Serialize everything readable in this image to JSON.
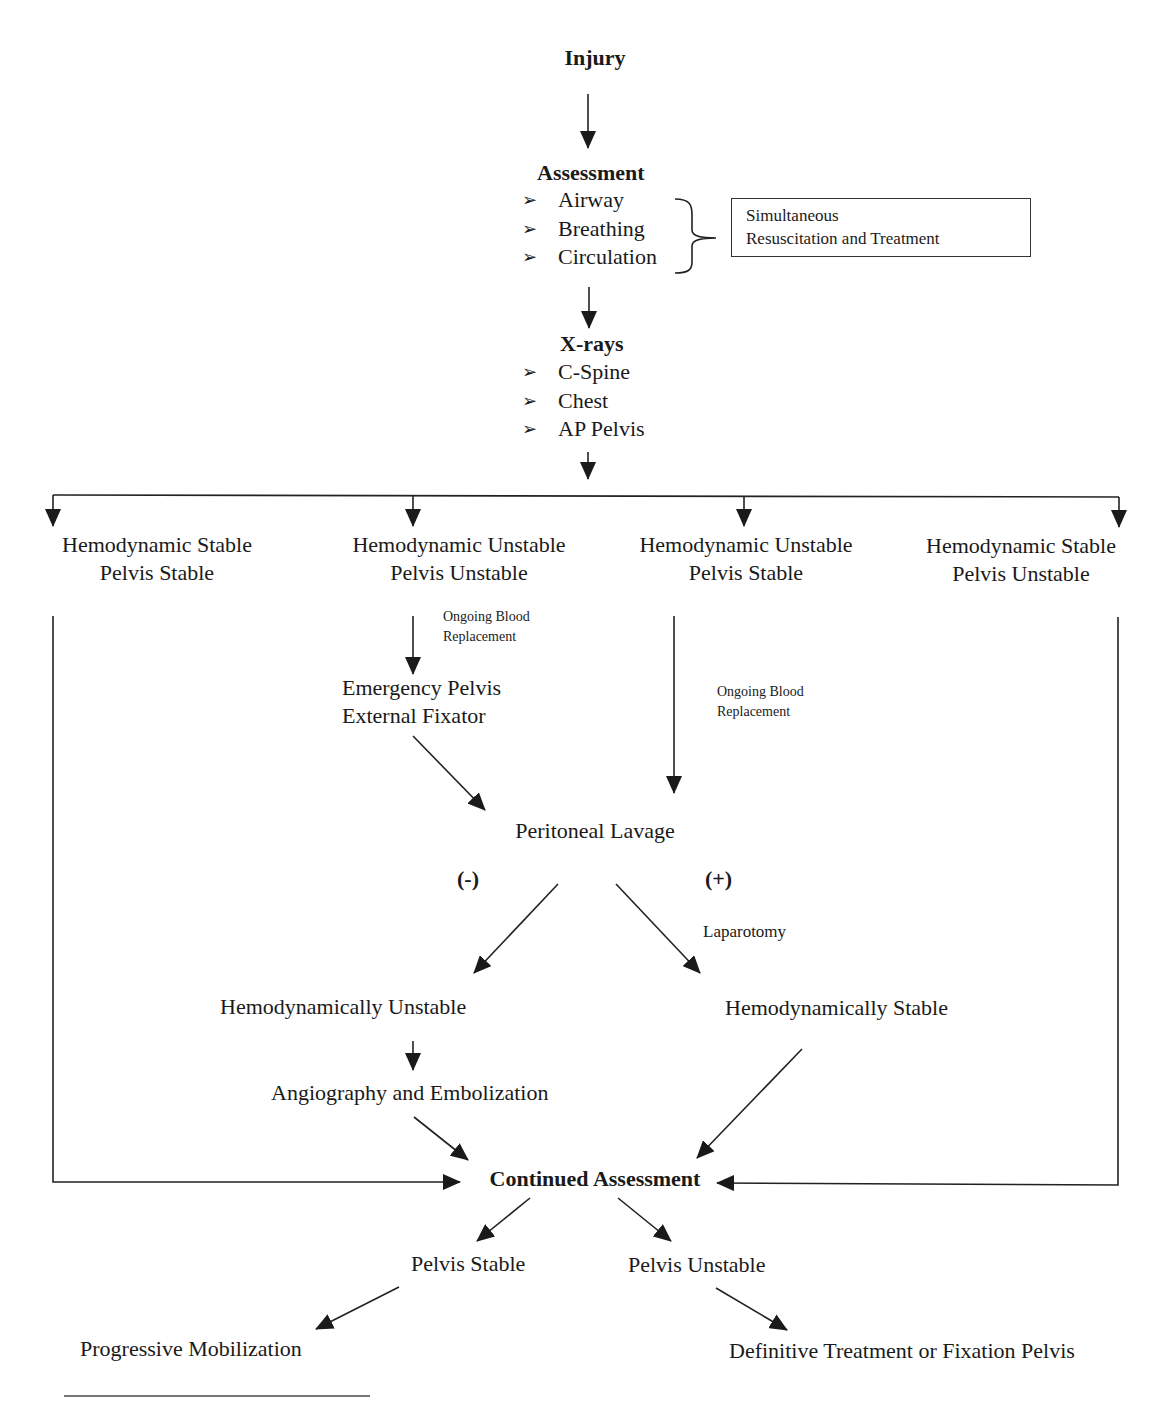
{
  "diagram": {
    "title": "Injury",
    "assessment": {
      "heading": "Assessment",
      "items": [
        "Airway",
        "Breathing",
        "Circulation"
      ],
      "bracket_note": {
        "line1": "Simultaneous",
        "line2": "Resuscitation and Treatment"
      }
    },
    "xrays": {
      "heading": "X-rays",
      "items": [
        "C-Spine",
        "Chest",
        "AP Pelvis"
      ]
    },
    "branches": [
      {
        "line1": "Hemodynamic Stable",
        "line2": "Pelvis Stable"
      },
      {
        "line1": "Hemodynamic Unstable",
        "line2": "Pelvis Unstable"
      },
      {
        "line1": "Hemodynamic Unstable",
        "line2": "Pelvis Stable"
      },
      {
        "line1": "Hemodynamic Stable",
        "line2": "Pelvis Unstable"
      }
    ],
    "edge_labels": {
      "blood_replacement_1": {
        "line1": "Ongoing Blood",
        "line2": "Replacement"
      },
      "blood_replacement_2": {
        "line1": "Ongoing Blood",
        "line2": "Replacement"
      },
      "negative": "(-)",
      "positive": "(+)",
      "laparotomy": "Laparotomy"
    },
    "emergency_fixator": {
      "line1": "Emergency Pelvis",
      "line2": "External Fixator"
    },
    "peritoneal_lavage": "Peritoneal Lavage",
    "hemo_unstable": "Hemodynamically Unstable",
    "hemo_stable": "Hemodynamically Stable",
    "angiography": "Angiography and Embolization",
    "continued_assessment": "Continued Assessment",
    "pelvis_stable": "Pelvis Stable",
    "pelvis_unstable": "Pelvis Unstable",
    "progressive_mobilization": "Progressive Mobilization",
    "definitive_treatment": "Definitive Treatment or Fixation Pelvis",
    "bullet_icon": "➢",
    "colors": {
      "ink": "#1a1a1a",
      "line": "#222222"
    }
  }
}
